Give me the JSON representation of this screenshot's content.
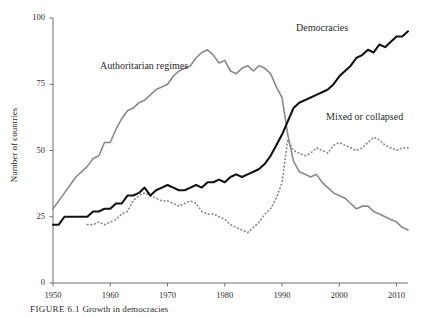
{
  "figure": {
    "caption_number": "FIGURE 6.1",
    "caption_text": "Growth in democracies"
  },
  "chart_data": {
    "type": "line",
    "title": "",
    "xlabel": "",
    "ylabel": "Number of countries",
    "xlim": [
      1950,
      2012
    ],
    "ylim": [
      0,
      100
    ],
    "xticks": [
      1950,
      1960,
      1970,
      1980,
      1990,
      2000,
      2010
    ],
    "yticks": [
      0,
      25,
      50,
      75,
      100
    ],
    "grid": false,
    "legend_position": "inline-annotations",
    "annotations": [
      {
        "text": "Authoritarian regimes",
        "series": "Authoritarian regimes"
      },
      {
        "text": "Democracies",
        "series": "Democracies"
      },
      {
        "text": "Mixed or collapsed",
        "series": "Mixed or collapsed"
      }
    ],
    "x": [
      1950,
      1951,
      1952,
      1953,
      1954,
      1955,
      1956,
      1957,
      1958,
      1959,
      1960,
      1961,
      1962,
      1963,
      1964,
      1965,
      1966,
      1967,
      1968,
      1969,
      1970,
      1971,
      1972,
      1973,
      1974,
      1975,
      1976,
      1977,
      1978,
      1979,
      1980,
      1981,
      1982,
      1983,
      1984,
      1985,
      1986,
      1987,
      1988,
      1989,
      1990,
      1991,
      1992,
      1993,
      1994,
      1995,
      1996,
      1997,
      1998,
      1999,
      2000,
      2001,
      2002,
      2003,
      2004,
      2005,
      2006,
      2007,
      2008,
      2009,
      2010,
      2011,
      2012
    ],
    "series": [
      {
        "name": "Democracies",
        "color": "#111111",
        "style": "solid",
        "values": [
          22,
          22,
          25,
          25,
          25,
          25,
          25,
          27,
          27,
          28,
          28,
          30,
          30,
          33,
          33,
          34,
          36,
          33,
          35,
          36,
          37,
          36,
          35,
          35,
          36,
          37,
          36,
          38,
          38,
          39,
          38,
          40,
          41,
          40,
          41,
          42,
          43,
          45,
          48,
          52,
          56,
          61,
          66,
          68,
          69,
          70,
          71,
          72,
          73,
          75,
          78,
          80,
          82,
          85,
          86,
          88,
          87,
          90,
          89,
          91,
          93,
          93,
          95
        ]
      },
      {
        "name": "Authoritarian regimes",
        "color": "#8a8a8a",
        "style": "solid",
        "values": [
          28,
          31,
          34,
          37,
          40,
          42,
          44,
          47,
          48,
          53,
          53,
          58,
          62,
          65,
          66,
          68,
          69,
          71,
          73,
          74,
          75,
          78,
          80,
          81,
          82,
          85,
          87,
          88,
          86,
          83,
          84,
          80,
          79,
          81,
          82,
          80,
          82,
          81,
          79,
          74,
          70,
          56,
          46,
          42,
          41,
          40,
          41,
          38,
          36,
          34,
          33,
          32,
          30,
          28,
          29,
          29,
          27,
          26,
          25,
          24,
          23,
          21,
          20
        ]
      },
      {
        "name": "Mixed or collapsed",
        "color": "#8a8a8a",
        "style": "dotted",
        "values": [
          null,
          null,
          null,
          null,
          null,
          null,
          22,
          22,
          23,
          22,
          23,
          24,
          26,
          27,
          31,
          33,
          34,
          33,
          32,
          31,
          31,
          30,
          29,
          30,
          31,
          30,
          27,
          26,
          26,
          25,
          24,
          22,
          21,
          20,
          19,
          21,
          23,
          26,
          28,
          32,
          38,
          54,
          50,
          49,
          48,
          49,
          51,
          50,
          49,
          52,
          53,
          52,
          51,
          50,
          51,
          53,
          55,
          54,
          52,
          51,
          50,
          51,
          51
        ]
      }
    ]
  }
}
